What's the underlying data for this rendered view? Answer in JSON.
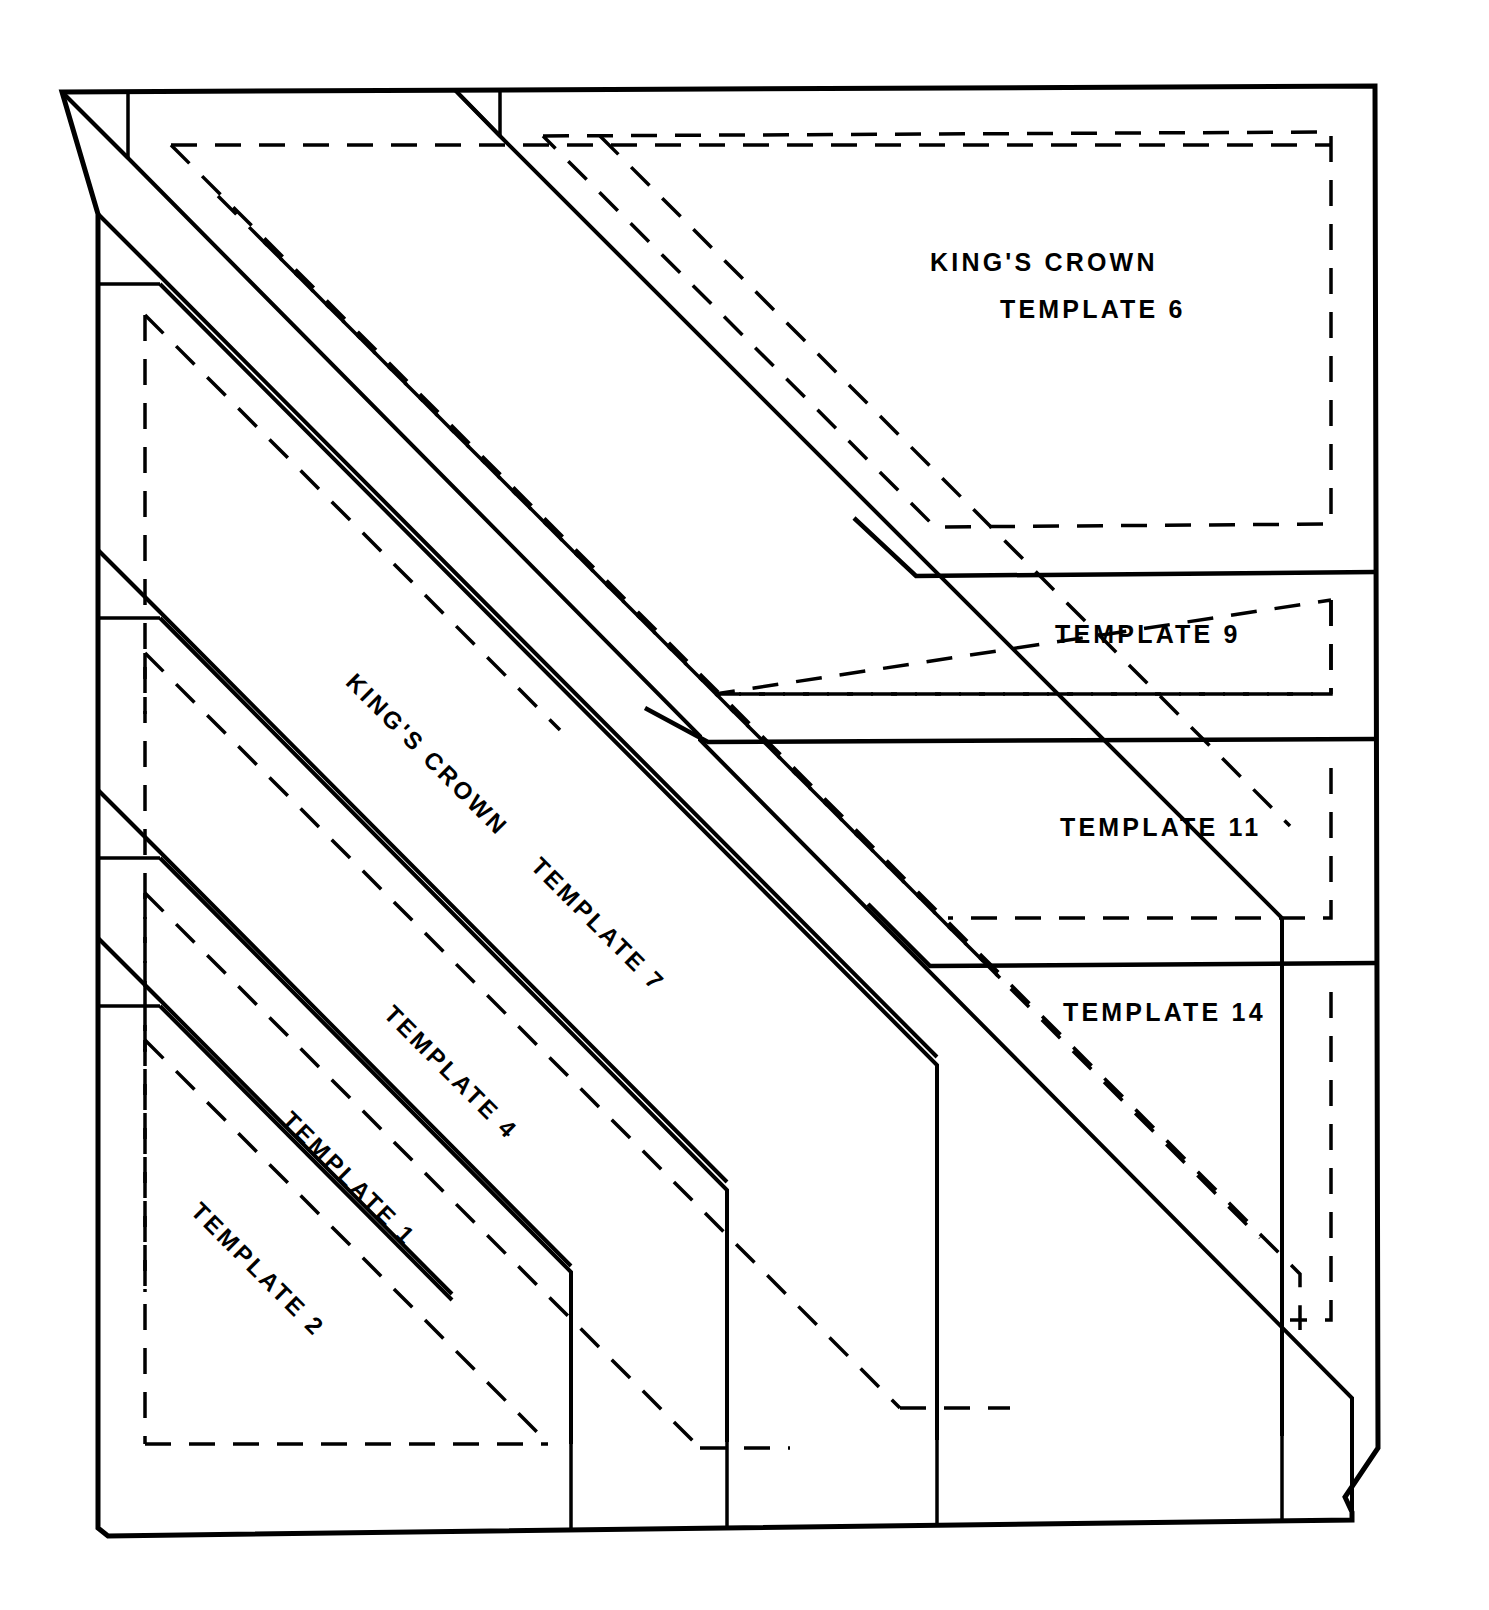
{
  "document": {
    "title": "KING'S CROWN",
    "kind": "quilt-template-cutting-diagram",
    "line_color": "#000000",
    "background_color": "#ffffff",
    "solid_line_label": "cutting line",
    "dashed_line_label": "seam line"
  },
  "labels": {
    "title_top": "KING'S CROWN",
    "template_6": "TEMPLATE 6",
    "template_9": "TEMPLATE 9",
    "template_11": "TEMPLATE 11",
    "template_14": "TEMPLATE 14",
    "title_diagonal": "KING'S CROWN",
    "template_7": "TEMPLATE 7",
    "template_4": "TEMPLATE 4",
    "template_1": "TEMPLATE 1",
    "template_2": "TEMPLATE 2"
  },
  "templates": [
    {
      "id": "6",
      "label": "TEMPLATE 6",
      "orientation": "horizontal",
      "shape": "chamfered-rectangle"
    },
    {
      "id": "9",
      "label": "TEMPLATE 9",
      "orientation": "horizontal",
      "shape": "chamfered-rectangle"
    },
    {
      "id": "11",
      "label": "TEMPLATE 11",
      "orientation": "horizontal",
      "shape": "chamfered-rectangle"
    },
    {
      "id": "14",
      "label": "TEMPLATE 14",
      "orientation": "horizontal",
      "shape": "chamfered-rectangle"
    },
    {
      "id": "7",
      "label": "TEMPLATE 7",
      "orientation": "diagonal",
      "shape": "diagonal-band"
    },
    {
      "id": "4",
      "label": "TEMPLATE 4",
      "orientation": "diagonal",
      "shape": "diagonal-band"
    },
    {
      "id": "1",
      "label": "TEMPLATE 1",
      "orientation": "diagonal",
      "shape": "diagonal-band"
    },
    {
      "id": "2",
      "label": "TEMPLATE 2",
      "orientation": "diagonal",
      "shape": "diagonal-band"
    }
  ]
}
